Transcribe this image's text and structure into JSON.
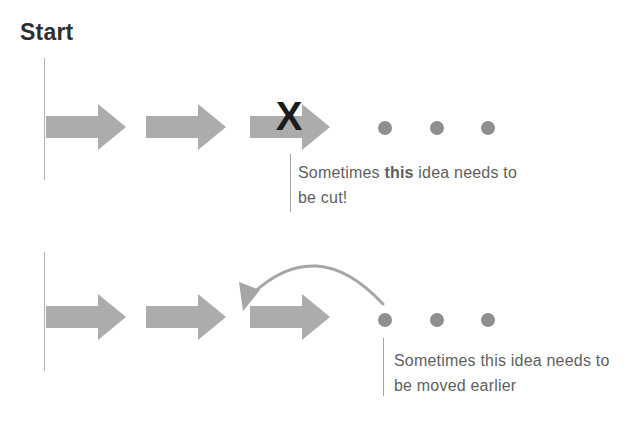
{
  "diagram": {
    "start_label": "Start"
  },
  "colors": {
    "background": "#ffffff",
    "arrow": "#acacac",
    "dot": "#8f8f8f",
    "x-mark": "#1b1b1b",
    "timeline-line": "#b3b3b3",
    "annotation-line": "#a6a6a6",
    "annotation-text": "#5f5f5f",
    "start-text": "#2e2e2e",
    "curve": "#a6a6a6"
  },
  "top_row": {
    "x_mark": "X",
    "annotation": {
      "part1": "Sometimes ",
      "bold": "this",
      "part2": " idea needs to",
      "line2": "be cut!"
    }
  },
  "bottom_row": {
    "annotation": {
      "line1": "Sometimes this idea needs to",
      "line2": "be moved earlier"
    }
  }
}
